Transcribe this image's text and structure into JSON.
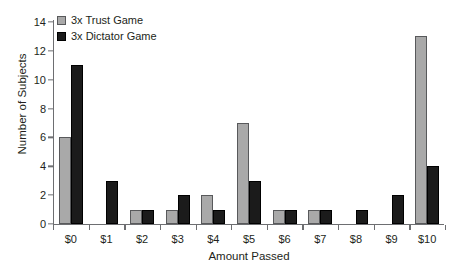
{
  "chart_data": {
    "type": "bar",
    "title": "",
    "xlabel": "Amount Passed",
    "ylabel": "Number of Subjects",
    "categories": [
      "$0",
      "$1",
      "$2",
      "$3",
      "$4",
      "$5",
      "$6",
      "$7",
      "$8",
      "$9",
      "$10"
    ],
    "series": [
      {
        "name": "3x Trust Game",
        "color": "#a9a9a9",
        "values": [
          6,
          0,
          1,
          1,
          2,
          7,
          1,
          1,
          0,
          0,
          13
        ]
      },
      {
        "name": "3x Dictator Game",
        "color": "#1b1b1b",
        "values": [
          11,
          3,
          1,
          2,
          1,
          3,
          1,
          1,
          1,
          2,
          4
        ]
      }
    ],
    "ylim": [
      0,
      14
    ],
    "y_ticks": [
      0,
      2,
      4,
      6,
      8,
      10,
      12,
      14
    ],
    "y_tick_labels": [
      "0",
      "2",
      "4",
      "6",
      "8",
      "10",
      "12",
      "14"
    ],
    "grid": false,
    "legend_position": "top-left"
  }
}
